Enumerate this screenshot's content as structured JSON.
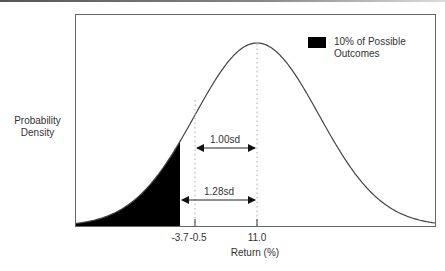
{
  "chart_data": {
    "type": "area",
    "title": "",
    "xlabel": "Return (%)",
    "ylabel": "Probability Density",
    "distribution": "normal",
    "mean": 11.0,
    "x_ticks": [
      {
        "value": -3.7,
        "label": "-3.7"
      },
      {
        "value": -0.5,
        "label": "-0.5"
      },
      {
        "value": 11.0,
        "label": "11.0"
      }
    ],
    "shaded_region": {
      "from": "-inf",
      "to": -3.7,
      "fill": "#000000",
      "label": "10% of Possible Outcomes"
    },
    "annotations": [
      {
        "label": "1.00sd",
        "from": -0.5,
        "to": 11.0
      },
      {
        "label": "1.28sd",
        "from": -3.7,
        "to": 11.0
      }
    ],
    "legend": {
      "position": "upper right",
      "entries": [
        "10% of Possible Outcomes"
      ]
    },
    "grid": false
  },
  "labels": {
    "ylabel_line1": "Probability",
    "ylabel_line2": "Density",
    "xlabel": "Return (%)",
    "tick_a": "-3.7",
    "tick_b": "-0.5",
    "tick_c": "11.0",
    "ann1": "1.00sd",
    "ann2": "1.28sd",
    "legend_line1": "10% of Possible",
    "legend_line2": "Outcomes"
  }
}
